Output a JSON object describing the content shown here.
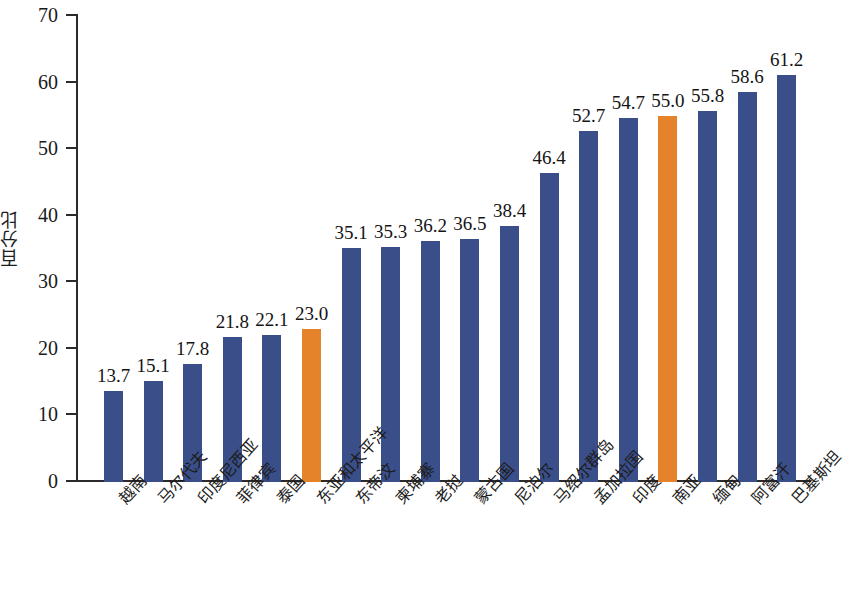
{
  "chart_data": {
    "type": "bar",
    "title": "",
    "subtitle": "",
    "xlabel": "",
    "ylabel": "百分比",
    "ylim": [
      0,
      70
    ],
    "ytick_labels": [
      "70",
      "60",
      "50",
      "40",
      "30",
      "20",
      "10",
      "0"
    ],
    "ytick_values": [
      70,
      60,
      50,
      40,
      30,
      20,
      10,
      0
    ],
    "ytick_step": 10,
    "grid": false,
    "legend": null,
    "categories": [
      "越南",
      "马尔代夫",
      "印度尼西亚",
      "菲律宾",
      "泰国",
      "东亚和太平洋",
      "东帝汶",
      "柬埔寨",
      "老挝",
      "蒙古国",
      "尼泊尔",
      "马绍尔群岛",
      "孟加拉国",
      "印度",
      "南亚",
      "缅甸",
      "阿富汗",
      "巴基斯坦"
    ],
    "values": [
      13.7,
      15.1,
      17.8,
      21.8,
      22.1,
      23.0,
      35.1,
      35.3,
      36.2,
      36.5,
      38.4,
      46.4,
      52.7,
      54.7,
      55.0,
      55.8,
      58.6,
      61.2
    ],
    "value_labels": [
      "13.7",
      "15.1",
      "17.8",
      "21.8",
      "22.1",
      "23.0",
      "35.1",
      "35.3",
      "36.2",
      "36.5",
      "38.4",
      "46.4",
      "52.7",
      "54.7",
      "55.0",
      "55.8",
      "58.6",
      "61.2"
    ],
    "bar_colors": [
      "#3a4f89",
      "#3a4f89",
      "#3a4f89",
      "#3a4f89",
      "#3a4f89",
      "#e5832a",
      "#3a4f89",
      "#3a4f89",
      "#3a4f89",
      "#3a4f89",
      "#3a4f89",
      "#3a4f89",
      "#3a4f89",
      "#3a4f89",
      "#e5832a",
      "#3a4f89",
      "#3a4f89",
      "#3a4f89"
    ],
    "highlight_color": "#e5832a",
    "series_color": "#3a4f89",
    "highlighted_categories": [
      "东亚和太平洋",
      "南亚"
    ]
  }
}
